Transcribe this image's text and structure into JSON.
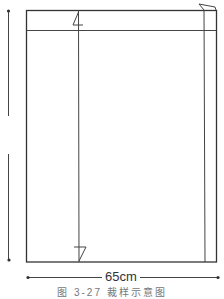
{
  "diagram": {
    "type": "sewing-pattern-layout",
    "width_label": "65cm",
    "height_label": "",
    "caption": "图 3-27  裁样示意图",
    "line_color": "#333333"
  }
}
